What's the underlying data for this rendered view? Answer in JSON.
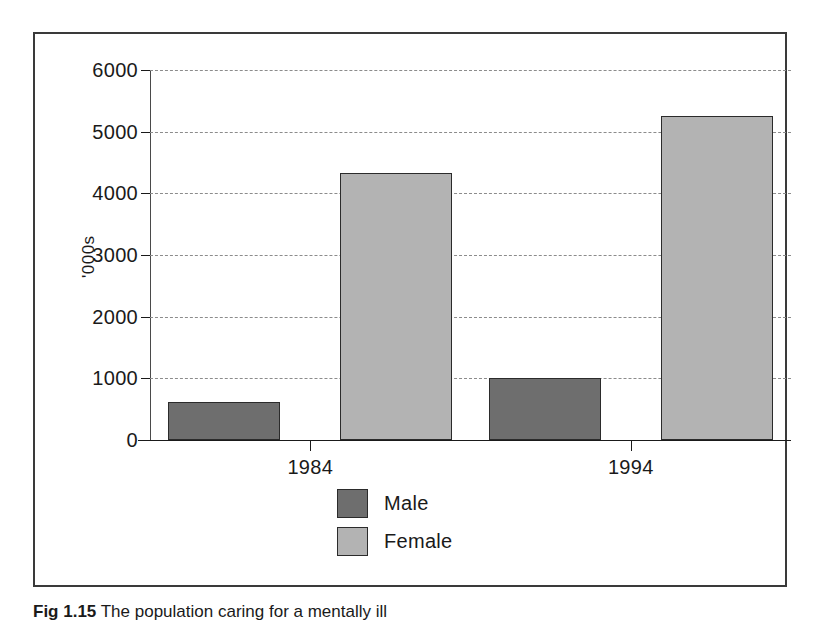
{
  "figure": {
    "caption_number": "Fig 1.15",
    "caption_text": "The population caring for a mentally ill",
    "frame_color": "#3a3a3a"
  },
  "chart_data": {
    "type": "bar",
    "title": "",
    "xlabel": "",
    "ylabel": "'000s",
    "categories": [
      "1984",
      "1994"
    ],
    "series": [
      {
        "name": "Male",
        "values": [
          620,
          1000
        ],
        "color": "#6e6e6e"
      },
      {
        "name": "Female",
        "values": [
          4330,
          5250
        ],
        "color": "#b3b3b3"
      }
    ],
    "ylim": [
      0,
      6000
    ],
    "yticks": [
      0,
      1000,
      2000,
      3000,
      4000,
      5000,
      6000
    ],
    "ytick_labels": [
      "0",
      "1000",
      "2000",
      "3000",
      "4000",
      "5000",
      "6000"
    ],
    "grid": true,
    "grid_style": "dashed",
    "grid_color": "#8c8c8c",
    "legend_position": "bottom",
    "legend": [
      {
        "label": "Male",
        "color": "#6e6e6e"
      },
      {
        "label": "Female",
        "color": "#b3b3b3"
      }
    ]
  }
}
